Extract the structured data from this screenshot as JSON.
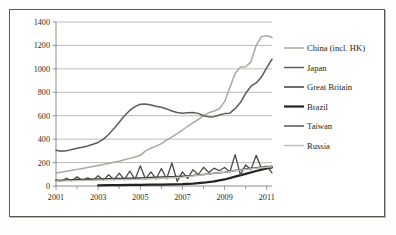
{
  "chart_data": {
    "type": "line",
    "title": "",
    "xlabel": "",
    "ylabel": "",
    "xlim": [
      2001,
      2011.25
    ],
    "ylim": [
      0,
      1400
    ],
    "ytick_values": [
      0,
      200,
      400,
      600,
      800,
      1000,
      1200,
      1400
    ],
    "ytick_labels": [
      "0",
      "200",
      "400",
      "600",
      "800",
      "1000",
      "1200",
      "1400"
    ],
    "xtick_values": [
      2001,
      2003,
      2005,
      2007,
      2009,
      2011
    ],
    "xtick_labels": [
      "2001",
      "2003",
      "2005",
      "2007",
      "2009",
      "2011"
    ],
    "minor_xticks": [
      2002,
      2004,
      2006,
      2008,
      2010
    ],
    "grid": "horizontal",
    "legend_position": "right",
    "series": [
      {
        "name": "China (incl. HK)",
        "color": "#a9a9a1",
        "width": 1.5,
        "x": [
          2001.0,
          2001.25,
          2001.5,
          2001.75,
          2002.0,
          2002.25,
          2002.5,
          2002.75,
          2003.0,
          2003.25,
          2003.5,
          2003.75,
          2004.0,
          2004.25,
          2004.5,
          2004.75,
          2005.0,
          2005.25,
          2005.5,
          2005.75,
          2006.0,
          2006.25,
          2006.5,
          2006.75,
          2007.0,
          2007.25,
          2007.5,
          2007.75,
          2008.0,
          2008.25,
          2008.5,
          2008.75,
          2009.0,
          2009.25,
          2009.5,
          2009.75,
          2010.0,
          2010.25,
          2010.5,
          2010.75,
          2011.0,
          2011.25
        ],
        "values": [
          110,
          118,
          126,
          134,
          142,
          150,
          158,
          166,
          175,
          184,
          193,
          202,
          212,
          224,
          236,
          248,
          262,
          300,
          322,
          340,
          362,
          392,
          420,
          448,
          478,
          510,
          540,
          568,
          600,
          625,
          640,
          660,
          720,
          840,
          960,
          1015,
          1018,
          1060,
          1200,
          1275,
          1285,
          1268
        ]
      },
      {
        "name": "Japan",
        "color": "#5d5d57",
        "width": 1.5,
        "x": [
          2001.0,
          2001.25,
          2001.5,
          2001.75,
          2002.0,
          2002.25,
          2002.5,
          2002.75,
          2003.0,
          2003.25,
          2003.5,
          2003.75,
          2004.0,
          2004.25,
          2004.5,
          2004.75,
          2005.0,
          2005.25,
          2005.5,
          2005.75,
          2006.0,
          2006.25,
          2006.5,
          2006.75,
          2007.0,
          2007.25,
          2007.5,
          2007.75,
          2008.0,
          2008.25,
          2008.5,
          2008.75,
          2009.0,
          2009.25,
          2009.5,
          2009.75,
          2010.0,
          2010.25,
          2010.5,
          2010.75,
          2011.0,
          2011.25
        ],
        "values": [
          305,
          296,
          300,
          312,
          322,
          330,
          342,
          356,
          372,
          400,
          440,
          490,
          545,
          600,
          645,
          678,
          698,
          700,
          692,
          680,
          672,
          658,
          640,
          628,
          622,
          625,
          628,
          620,
          600,
          590,
          592,
          606,
          618,
          622,
          660,
          712,
          790,
          852,
          880,
          930,
          1010,
          1082
        ]
      },
      {
        "name": "Great Britain",
        "color": "#3c3c38",
        "width": 1.5,
        "x": [
          2001.0,
          2001.5,
          2002.0,
          2002.5,
          2003.0,
          2003.5,
          2004.0,
          2004.5,
          2005.0,
          2005.5,
          2006.0,
          2006.5,
          2007.0,
          2007.5,
          2008.0,
          2008.5,
          2009.0,
          2009.5,
          2010.0,
          2010.5,
          2011.0,
          2011.25
        ],
        "values": [
          48,
          52,
          56,
          58,
          60,
          62,
          64,
          66,
          68,
          72,
          76,
          80,
          84,
          90,
          98,
          108,
          118,
          132,
          146,
          156,
          164,
          168
        ]
      },
      {
        "name": "Brazil",
        "color": "#23231f",
        "width": 2.2,
        "x": [
          2003.0,
          2003.5,
          2004.0,
          2004.5,
          2005.0,
          2005.5,
          2006.0,
          2006.5,
          2007.0,
          2007.5,
          2008.0,
          2008.5,
          2009.0,
          2009.5,
          2010.0,
          2010.5,
          2011.0,
          2011.25
        ],
        "values": [
          6,
          7,
          8,
          9,
          10,
          11,
          12,
          14,
          16,
          20,
          28,
          40,
          56,
          80,
          104,
          128,
          150,
          158
        ]
      },
      {
        "name": "Taiwan",
        "color": "#4a4a45",
        "width": 1.3,
        "x": [
          2001.0,
          2001.25,
          2001.5,
          2001.75,
          2002.0,
          2002.25,
          2002.5,
          2002.75,
          2003.0,
          2003.25,
          2003.5,
          2003.75,
          2004.0,
          2004.25,
          2004.5,
          2004.75,
          2005.0,
          2005.25,
          2005.5,
          2005.75,
          2006.0,
          2006.25,
          2006.5,
          2006.75,
          2007.0,
          2007.25,
          2007.5,
          2007.75,
          2008.0,
          2008.25,
          2008.5,
          2008.75,
          2009.0,
          2009.25,
          2009.5,
          2009.75,
          2010.0,
          2010.25,
          2010.5,
          2010.75,
          2011.0,
          2011.25
        ],
        "values": [
          52,
          40,
          66,
          44,
          78,
          46,
          70,
          48,
          88,
          50,
          96,
          52,
          110,
          54,
          128,
          56,
          172,
          58,
          120,
          60,
          150,
          62,
          196,
          40,
          120,
          64,
          140,
          96,
          160,
          116,
          152,
          130,
          158,
          120,
          268,
          96,
          180,
          140,
          262,
          150,
          170,
          112
        ]
      },
      {
        "name": "Russia",
        "color": "#bdbdb5",
        "width": 1.4,
        "x": [
          2001.0,
          2001.5,
          2002.0,
          2002.5,
          2003.0,
          2003.5,
          2004.0,
          2004.5,
          2005.0,
          2005.5,
          2006.0,
          2006.5,
          2007.0,
          2007.5,
          2008.0,
          2008.5,
          2009.0,
          2009.5,
          2010.0,
          2010.5,
          2011.0,
          2011.25
        ],
        "values": [
          42,
          44,
          46,
          48,
          50,
          52,
          54,
          56,
          58,
          62,
          66,
          70,
          76,
          86,
          96,
          108,
          118,
          130,
          142,
          152,
          160,
          164
        ]
      }
    ]
  }
}
